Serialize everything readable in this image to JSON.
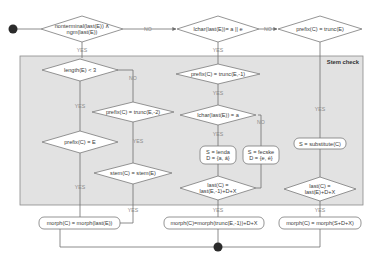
{
  "diagram": {
    "type": "flowchart",
    "region": {
      "title": "Stem check"
    },
    "decisions": {
      "d_nonterminal": {
        "line1": "nonterminal(last(E)) ∧",
        "line2": "ngm(last(E))"
      },
      "d_lchar_ae": {
        "text": "lchar(last(E))= a || e"
      },
      "d_prefix_trunc": {
        "text": "prefix(C) = trunc(E)"
      },
      "d_length": {
        "text": "length(E) < 3"
      },
      "d_prefix_trunc2": {
        "text": "prefix(C) = trunc(E,-2)"
      },
      "d_prefix_e": {
        "text": "prefix(C) = E"
      },
      "d_stem": {
        "text": "stem(C) = stem(E)"
      },
      "d_prefix_trunc1": {
        "text": "prefix(C) = trunc(E,-1)"
      },
      "d_lchar_a": {
        "text": "lchar(last(E)) = a"
      },
      "d_last_trunc": {
        "line1": "last(C) =",
        "line2": "last(E,-1)+D+X"
      },
      "d_last_sub": {
        "line1": "last(C) =",
        "line2": "last(E)+D+X"
      }
    },
    "actions": {
      "a_lenda": {
        "line1": "S = lenda",
        "line2": "D = {a, á}"
      },
      "a_fecske": {
        "line1": "S = fecske",
        "line2": "D = {e, é}"
      },
      "a_substitute": {
        "text": "S = substitute(C)"
      }
    },
    "results": {
      "r_morph_last": {
        "text": "morph(C) = morph(last(E))"
      },
      "r_morph_trunc": {
        "text": "morph(C)=morph(trunc(E,-1))+D+X"
      },
      "r_morph_sub": {
        "text": "morph(C) = morph(S+D+X)"
      }
    },
    "edge_labels": {
      "yes": "YES",
      "no": "NO"
    },
    "colors": {
      "region_fill": "#e2e2e2",
      "line": "#6e6e6e",
      "node_dot": "#2b2b2b"
    }
  }
}
